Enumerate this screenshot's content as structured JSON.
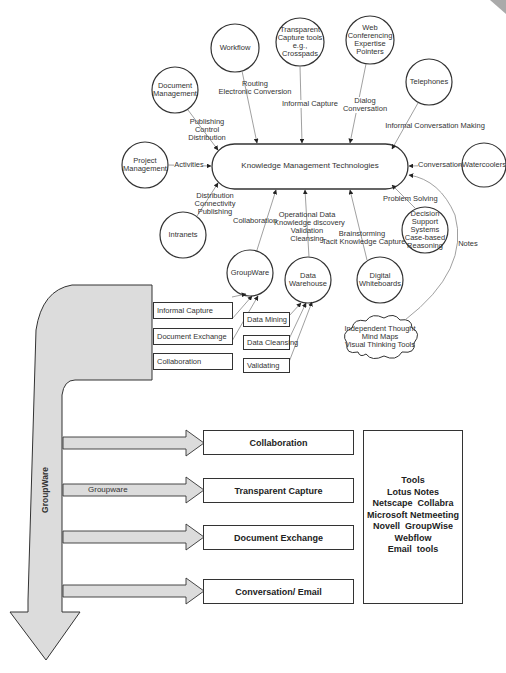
{
  "diagram": {
    "center": {
      "label": "Knowledge Management Technologies"
    },
    "nodes": [
      {
        "id": "workflow",
        "label": "Workflow",
        "edge_label": "Routing\nElectronic Conversion"
      },
      {
        "id": "transparent-capture-tools",
        "label": "Transparent\nCapture tools\ne.g.,\nCrosspads",
        "edge_label": "Informal Capture"
      },
      {
        "id": "web-conferencing",
        "label": "Web\nConferencing\nExpertise\nPointers",
        "edge_label": "Dialog\nConversation"
      },
      {
        "id": "telephones",
        "label": "Telephones",
        "edge_label": "Informal Conversation Making"
      },
      {
        "id": "document-management",
        "label": "Document\nManagement",
        "edge_label": "Publishing\nControl\nDistribution"
      },
      {
        "id": "project-management",
        "label": "Project\nManagement",
        "edge_label": "Activities"
      },
      {
        "id": "watercoolers",
        "label": "Watercoolers",
        "edge_label": "Conversation"
      },
      {
        "id": "intranets",
        "label": "Intranets",
        "edge_label": "Distribution\nConnectivity\nPublishing"
      },
      {
        "id": "groupware",
        "label": "GroupWare",
        "edge_label": "Collaboration"
      },
      {
        "id": "data-warehouse",
        "label": "Data\nWarehouse",
        "edge_label": "Operational Data\nKnowledge discovery\nValidation\nCleansing"
      },
      {
        "id": "digital-whiteboards",
        "label": "Digital\nWhiteboards",
        "edge_label": "Brainstorming\nTacit Knowledge Capture"
      },
      {
        "id": "decision-support",
        "label": "Decision\nSupport\nSystems\nCase-based\nReasoning",
        "edge_label": "Problem Solving"
      },
      {
        "id": "independent-thought",
        "label": "Independent Thought\nMind Maps\nVisual Thinking Tools",
        "edge_label": "Notes"
      }
    ],
    "groupware_inputs": [
      "Informal Capture",
      "Document Exchange",
      "Collaboration"
    ],
    "warehouse_inputs": [
      "Data Mining",
      "Data Cleansing",
      "Validating"
    ],
    "bottom": {
      "vertical_label": "GroupWare",
      "arrow_label": "Groupware",
      "outputs": [
        "Collaboration",
        "Transparent Capture",
        "Document Exchange",
        "Conversation/ Email"
      ],
      "tools_title": "Tools",
      "tools": [
        "Lotus Notes",
        "Netscape  Collabra",
        "Microsoft Netmeeting",
        "Novell  GroupWise",
        "Webflow",
        "Email  tools"
      ]
    },
    "colors": {
      "stroke": "#333333",
      "fill_band": "#dcdcdc",
      "line": "#888888"
    }
  }
}
